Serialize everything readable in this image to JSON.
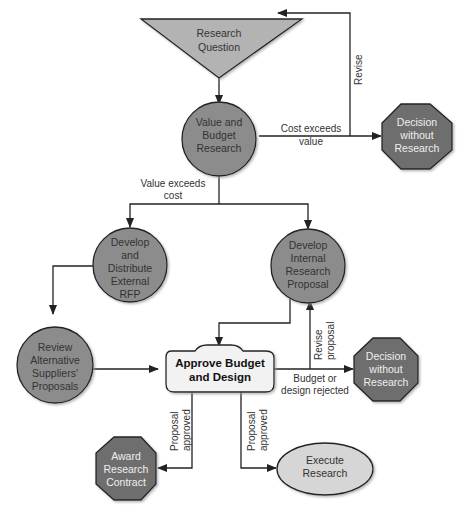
{
  "diagram": {
    "type": "flowchart",
    "colors": {
      "circle_fill": "#8c8c8c",
      "octagon_fill": "#6e6e6e",
      "triangle_fill": "#b3b3b3",
      "ellipse_fill": "#d6d6d6",
      "decision_box_fill": "#f2f2f2",
      "stroke": "#222222"
    },
    "nodes": {
      "research_question": {
        "shape": "triangle",
        "lines": [
          "Research",
          "Question"
        ]
      },
      "value_budget": {
        "shape": "circle",
        "lines": [
          "Value and",
          "Budget",
          "Research"
        ]
      },
      "decision_top": {
        "shape": "octagon",
        "lines": [
          "Decision",
          "without",
          "Research"
        ]
      },
      "external_rfp": {
        "shape": "circle",
        "lines": [
          "Develop",
          "and",
          "Distribute",
          "External",
          "RFP"
        ]
      },
      "internal_proposal": {
        "shape": "circle",
        "lines": [
          "Develop",
          "Internal",
          "Research",
          "Proposal"
        ]
      },
      "review_suppliers": {
        "shape": "circle",
        "lines": [
          "Review",
          "Alternative",
          "Suppliers'",
          "Proposals"
        ]
      },
      "approve": {
        "shape": "rounded-box",
        "lines": [
          "Approve Budget",
          "and Design"
        ]
      },
      "decision_bottom": {
        "shape": "octagon",
        "lines": [
          "Decision",
          "without",
          "Research"
        ]
      },
      "award_contract": {
        "shape": "octagon",
        "lines": [
          "Award",
          "Research",
          "Contract"
        ]
      },
      "execute": {
        "shape": "ellipse",
        "lines": [
          "Execute",
          "Research"
        ]
      }
    },
    "edge_labels": {
      "revise": "Revise",
      "cost_exceeds": [
        "Cost exceeds",
        "value"
      ],
      "value_exceeds": [
        "Value exceeds",
        "cost"
      ],
      "revise_proposal": [
        "Revise",
        "proposal"
      ],
      "rejected": [
        "Budget or",
        "design rejected"
      ],
      "approved_left": [
        "Proposal",
        "approved"
      ],
      "approved_right": [
        "Proposal",
        "approved"
      ]
    }
  }
}
